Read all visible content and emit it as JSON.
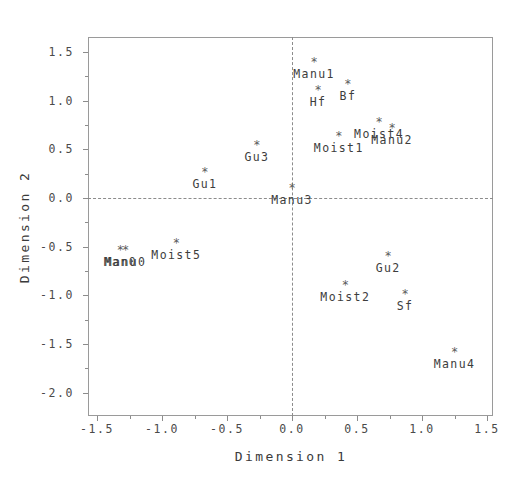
{
  "chart_data": {
    "type": "scatter",
    "title": "",
    "xlabel": "Dimension 1",
    "ylabel": "Dimension 2",
    "xlim": [
      -1.57,
      1.55
    ],
    "ylim": [
      -2.18,
      1.72
    ],
    "xticks": [
      -1.5,
      -1.0,
      -0.5,
      0.0,
      0.5,
      1.0,
      1.5
    ],
    "xticklabels": [
      "-1.5",
      "-1.0",
      "-0.5",
      "0.0",
      "0.5",
      "1.0",
      "1.5"
    ],
    "yticks": [
      1.5,
      1.0,
      0.5,
      0.0,
      -0.5,
      -1.0,
      -1.5,
      -2.0
    ],
    "yticklabels": [
      "1.5",
      "1.0",
      "0.5",
      "0.0",
      "-0.5",
      "-1.0",
      "-1.5",
      "-2.0"
    ],
    "minor_ticks": true,
    "grid": false,
    "legend": null,
    "marker": "*",
    "reference_lines": [
      {
        "axis": "y",
        "value": 0.0,
        "style": "dashed"
      },
      {
        "axis": "x",
        "value": 0.0,
        "style": "dashed"
      }
    ],
    "points": [
      {
        "label": "Manu1",
        "x": 0.17,
        "y": 1.4,
        "label_pos": "below"
      },
      {
        "label": "Hf",
        "x": 0.2,
        "y": 1.11,
        "label_pos": "below"
      },
      {
        "label": "Bf",
        "x": 0.43,
        "y": 1.17,
        "label_pos": "below"
      },
      {
        "label": "Moist4",
        "x": 0.67,
        "y": 0.78,
        "label_pos": "below"
      },
      {
        "label": "Manu2",
        "x": 0.77,
        "y": 0.72,
        "label_pos": "below"
      },
      {
        "label": "Moist1",
        "x": 0.36,
        "y": 0.64,
        "label_pos": "below"
      },
      {
        "label": "Gu3",
        "x": -0.27,
        "y": 0.54,
        "label_pos": "below"
      },
      {
        "label": "Gu1",
        "x": -0.67,
        "y": 0.27,
        "label_pos": "below"
      },
      {
        "label": "Manu3",
        "x": 0.0,
        "y": 0.1,
        "label_pos": "below"
      },
      {
        "label": "Man0",
        "x": -1.32,
        "y": -0.53,
        "label_pos": "below"
      },
      {
        "label": "Manu0",
        "x": -1.28,
        "y": -0.53,
        "label_pos": "below"
      },
      {
        "label": "Moist5",
        "x": -0.89,
        "y": -0.46,
        "label_pos": "below"
      },
      {
        "label": "Gu2",
        "x": 0.74,
        "y": -0.6,
        "label_pos": "below"
      },
      {
        "label": "Moist2",
        "x": 0.41,
        "y": -0.89,
        "label_pos": "below"
      },
      {
        "label": "Sf",
        "x": 0.87,
        "y": -0.99,
        "label_pos": "below"
      },
      {
        "label": "Manu4",
        "x": 1.25,
        "y": -1.58,
        "label_pos": "below"
      }
    ]
  }
}
